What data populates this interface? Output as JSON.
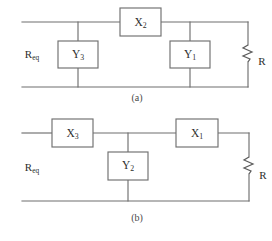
{
  "figure": {
    "panels": [
      {
        "id": "panel-a",
        "caption": "(a)",
        "input_port": {
          "base": "R",
          "sub": "eq"
        },
        "load": {
          "label": "R",
          "icon": "resistor-zigzag-icon"
        },
        "series_elements": [
          {
            "base": "X",
            "sub": "2"
          }
        ],
        "shunt_elements": [
          {
            "base": "Y",
            "sub": "3"
          },
          {
            "base": "Y",
            "sub": "1"
          }
        ]
      },
      {
        "id": "panel-b",
        "caption": "(b)",
        "input_port": {
          "base": "R",
          "sub": "eq"
        },
        "load": {
          "label": "R",
          "icon": "resistor-zigzag-icon"
        },
        "series_elements": [
          {
            "base": "X",
            "sub": "3"
          },
          {
            "base": "X",
            "sub": "1"
          }
        ],
        "shunt_elements": [
          {
            "base": "Y",
            "sub": "2"
          }
        ]
      }
    ]
  },
  "style": {
    "wire_color": "#6f6f6f",
    "box_fill": "#ffffff",
    "box_stroke": "#6f6f6f",
    "text_color": "#2e2e2e",
    "background": "#ffffff"
  }
}
